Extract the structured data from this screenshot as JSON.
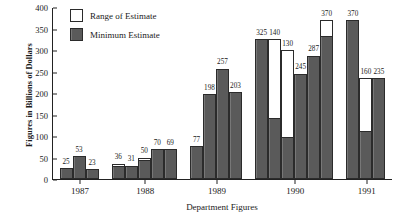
{
  "chart_data": {
    "type": "bar",
    "title": "",
    "xlabel": "Department Figures",
    "ylabel": "Figures in Billions of Dollars",
    "ylim": [
      0,
      400
    ],
    "yticks": [
      0,
      50,
      100,
      150,
      200,
      250,
      300,
      350,
      400
    ],
    "grid": false,
    "legend_position": "top-left",
    "legend": [
      {
        "label": "Range of Estimate",
        "swatch": "white"
      },
      {
        "label": "Minimum Estimate",
        "swatch": "dark"
      }
    ],
    "categories": [
      "1987",
      "1988",
      "1989",
      "1990",
      "1991"
    ],
    "note": "Each bar's dark portion is the Minimum Estimate; the white portion above it extends to the top of the Range of Estimate. The printed number is the Minimum Estimate value.",
    "groups": [
      {
        "category": "1987",
        "bars": [
          {
            "label": "25",
            "minimum": 25,
            "range_top": 25
          },
          {
            "label": "53",
            "minimum": 53,
            "range_top": 53
          },
          {
            "label": "23",
            "minimum": 23,
            "range_top": 23
          }
        ]
      },
      {
        "category": "1988",
        "bars": [
          {
            "label": "36",
            "minimum": 27,
            "range_top": 36
          },
          {
            "label": "31",
            "minimum": 31,
            "range_top": 31
          },
          {
            "label": "50",
            "minimum": 41,
            "range_top": 50
          },
          {
            "label": "70",
            "minimum": 70,
            "range_top": 70
          },
          {
            "label": "69",
            "minimum": 69,
            "range_top": 69
          }
        ]
      },
      {
        "category": "1989",
        "bars": [
          {
            "label": "77",
            "minimum": 77,
            "range_top": 77
          },
          {
            "label": "198",
            "minimum": 198,
            "range_top": 198
          },
          {
            "label": "257",
            "minimum": 257,
            "range_top": 257
          },
          {
            "label": "203",
            "minimum": 203,
            "range_top": 203
          }
        ]
      },
      {
        "category": "1990",
        "bars": [
          {
            "label": "325",
            "minimum": 325,
            "range_top": 325
          },
          {
            "label": "140",
            "minimum": 140,
            "range_top": 325
          },
          {
            "label": "130",
            "minimum": 95,
            "range_top": 300
          },
          {
            "label": "245",
            "minimum": 245,
            "range_top": 245
          },
          {
            "label": "287",
            "minimum": 287,
            "range_top": 287
          },
          {
            "label": "370",
            "minimum": 330,
            "range_top": 370
          }
        ]
      },
      {
        "category": "1991",
        "bars": [
          {
            "label": "370",
            "minimum": 370,
            "range_top": 370
          },
          {
            "label": "160",
            "minimum": 110,
            "range_top": 235
          },
          {
            "label": "235",
            "minimum": 235,
            "range_top": 235
          }
        ]
      }
    ]
  }
}
